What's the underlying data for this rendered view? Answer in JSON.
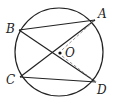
{
  "diagram": {
    "type": "circle-geometry",
    "circle": {
      "cx": 59,
      "cy": 52,
      "r": 44,
      "stroke": "#222222"
    },
    "center": {
      "label": "O",
      "x": 60,
      "y": 53
    },
    "points": {
      "A": {
        "label": "A",
        "x": 95,
        "y": 20
      },
      "B": {
        "label": "B",
        "x": 19,
        "y": 30
      },
      "C": {
        "label": "C",
        "x": 20,
        "y": 77
      },
      "D": {
        "label": "D",
        "x": 96,
        "y": 82
      }
    },
    "segments_solid": [
      [
        "B",
        "A"
      ],
      [
        "B",
        "D"
      ],
      [
        "C",
        "A"
      ],
      [
        "C",
        "D"
      ]
    ],
    "segments_dashed": [
      [
        "O",
        "A"
      ],
      [
        "O",
        "D"
      ]
    ],
    "dashed_color": "#999999"
  }
}
